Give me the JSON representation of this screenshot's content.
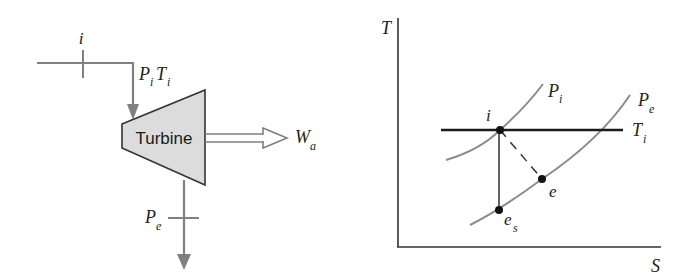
{
  "turbine_schematic": {
    "component_label": "Turbine",
    "inlet": {
      "state_label": "i",
      "pressure_label": "P",
      "pressure_sub": "i",
      "temperature_label": "T",
      "temperature_sub": "i"
    },
    "exit": {
      "pressure_label": "P",
      "pressure_sub": "e"
    },
    "work": {
      "label": "W",
      "sub": "a"
    },
    "colors": {
      "pipe": "#808080",
      "turbine_fill": "#dcdcdc",
      "turbine_stroke": "#333333"
    }
  },
  "ts_diagram": {
    "y_axis_label": "T",
    "x_axis_label": "S",
    "isobars": [
      {
        "name": "P",
        "sub": "i"
      },
      {
        "name": "P",
        "sub": "e"
      }
    ],
    "isotherm": {
      "name": "T",
      "sub": "i"
    },
    "points": [
      {
        "label": "i",
        "sub": ""
      },
      {
        "label": "e",
        "sub": ""
      },
      {
        "label": "e",
        "sub": "s"
      }
    ],
    "colors": {
      "axes": "#333333",
      "isobar": "#8c8c8c",
      "isotherm": "#1a1a1a",
      "point": "#111111"
    }
  }
}
